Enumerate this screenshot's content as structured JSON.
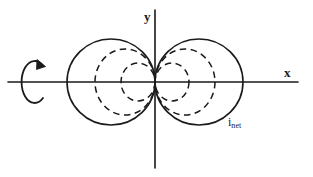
{
  "figure": {
    "kind": "radiation-pattern-diagram",
    "background_color": "#ffffff",
    "stroke_color": "#1a1a1a",
    "axes": {
      "x_label": "x",
      "y_label": "y",
      "origin": {
        "x": 155,
        "y": 82
      },
      "x_axis_span": {
        "x1": 8,
        "x2": 298,
        "y": 82
      },
      "y_axis_span": {
        "y1": 10,
        "y2": 168,
        "x": 155
      }
    },
    "labels": {
      "net_current_symbol": "i",
      "net_current_subscript": "net"
    },
    "rotation_indicator": {
      "name": "rotation-about-x-axis-arrow",
      "center": {
        "x": 33,
        "y": 82
      },
      "rx": 13,
      "ry": 21,
      "direction": "clockwise-as-drawn",
      "opening": "right"
    },
    "curves": [
      {
        "name": "net-pattern-lobe-left",
        "style": "solid",
        "side": "left",
        "center": {
          "x": 111,
          "y": 82
        },
        "rx": 44,
        "ry": 43
      },
      {
        "name": "net-pattern-lobe-right",
        "style": "solid",
        "side": "right",
        "center": {
          "x": 199,
          "y": 82
        },
        "rx": 44,
        "ry": 43
      },
      {
        "name": "element-pattern-outer-left",
        "style": "dashed",
        "side": "left",
        "center": {
          "x": 125,
          "y": 82
        },
        "rx": 30,
        "ry": 33
      },
      {
        "name": "element-pattern-outer-right",
        "style": "dashed",
        "side": "right",
        "center": {
          "x": 185,
          "y": 82
        },
        "rx": 30,
        "ry": 33
      },
      {
        "name": "element-pattern-inner-left",
        "style": "dashed",
        "side": "left",
        "center": {
          "x": 138,
          "y": 82
        },
        "rx": 17,
        "ry": 19
      },
      {
        "name": "element-pattern-inner-right",
        "style": "dashed",
        "side": "right",
        "center": {
          "x": 172,
          "y": 82
        },
        "rx": 17,
        "ry": 19
      }
    ]
  }
}
